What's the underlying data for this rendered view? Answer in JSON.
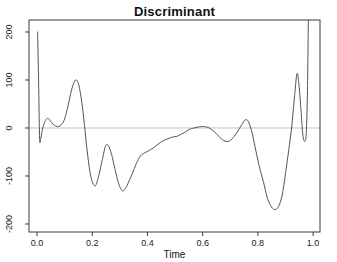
{
  "chart_data": {
    "type": "line",
    "title": "Discriminant",
    "xlabel": "Time",
    "ylabel": "",
    "xlim": [
      -0.029,
      1.025
    ],
    "ylim": [
      -216.7,
      225
    ],
    "xticks": [
      0.0,
      0.2,
      0.4,
      0.6,
      0.8,
      1.0
    ],
    "xtick_labels": [
      "0.0",
      "0.2",
      "0.4",
      "0.6",
      "0.8",
      "1.0"
    ],
    "yticks": [
      -200,
      -100,
      0,
      100,
      200
    ],
    "ytick_labels": [
      "-200",
      "-100",
      "0",
      "100",
      "200"
    ],
    "grid": false,
    "reference_line_y": 0,
    "legend": null,
    "colors": {
      "line": "#555555",
      "box": "#3a3a3a",
      "zero_line": "#c4c4c4",
      "text": "#1a1a1a",
      "background": "#ffffff"
    },
    "series": [
      {
        "name": "discriminant",
        "x": [
          0.002,
          0.005,
          0.008,
          0.01,
          0.013,
          0.018,
          0.025,
          0.033,
          0.04,
          0.048,
          0.058,
          0.068,
          0.078,
          0.088,
          0.098,
          0.11,
          0.122,
          0.134,
          0.143,
          0.152,
          0.162,
          0.172,
          0.182,
          0.192,
          0.202,
          0.212,
          0.222,
          0.235,
          0.248,
          0.258,
          0.27,
          0.282,
          0.295,
          0.308,
          0.318,
          0.33,
          0.345,
          0.36,
          0.375,
          0.39,
          0.405,
          0.42,
          0.438,
          0.455,
          0.472,
          0.49,
          0.508,
          0.522,
          0.538,
          0.552,
          0.568,
          0.585,
          0.6,
          0.615,
          0.632,
          0.65,
          0.668,
          0.685,
          0.7,
          0.715,
          0.73,
          0.745,
          0.755,
          0.765,
          0.778,
          0.79,
          0.805,
          0.82,
          0.835,
          0.85,
          0.862,
          0.875,
          0.888,
          0.9,
          0.912,
          0.922,
          0.932,
          0.941,
          0.948,
          0.956,
          0.963,
          0.97,
          0.975,
          0.979,
          0.983
        ],
        "y": [
          200,
          120,
          20,
          -28,
          -24,
          -8,
          8,
          18,
          20,
          15,
          8,
          4,
          3,
          7,
          16,
          40,
          72,
          95,
          100,
          88,
          55,
          5,
          -50,
          -92,
          -115,
          -120,
          -103,
          -70,
          -38,
          -36,
          -55,
          -85,
          -115,
          -130,
          -128,
          -115,
          -95,
          -74,
          -58,
          -52,
          -47,
          -42,
          -34,
          -27,
          -23,
          -19,
          -17,
          -13,
          -8,
          -3,
          0,
          2,
          3,
          2,
          -3,
          -12,
          -23,
          -28,
          -26,
          -17,
          -4,
          10,
          17,
          14,
          -8,
          -40,
          -80,
          -112,
          -147,
          -165,
          -170,
          -163,
          -140,
          -95,
          -45,
          0,
          60,
          112,
          95,
          40,
          -15,
          -28,
          -12,
          60,
          230
        ]
      }
    ]
  }
}
